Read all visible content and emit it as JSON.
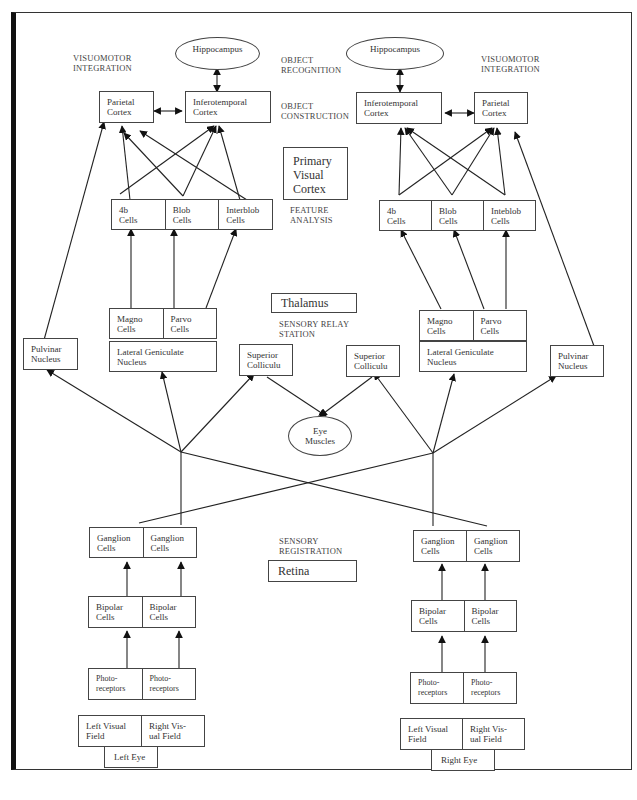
{
  "labels": {
    "visuomotor_left": "VISUOMOTOR\nINTEGRATION",
    "visuomotor_right": "VISUOMOTOR\nINTEGRATION",
    "object_recognition": "OBJECT\nRECOGNITION",
    "object_construction": "OBJECT\nCONSTRUCTION",
    "feature_analysis": "FEATURE\nANALYSIS",
    "sensory_relay": "SENSORY RELAY\nSTATION",
    "sensory_registration": "SENSORY\nREGISTRATION"
  },
  "region_boxes": {
    "primary_visual_cortex": "Primary\nVisual\nCortex",
    "thalamus": "Thalamus",
    "retina": "Retina"
  },
  "left": {
    "hippocampus": "Hippocampus",
    "parietal": "Parietal\nCortex",
    "inferotemporal": "Inferotemporal\nCortex",
    "cortex_cells": [
      "4b\nCells",
      "Blob\nCells",
      "Interblob\nCells"
    ],
    "lgn_cells": [
      "Magno\nCells",
      "Parvo\nCells"
    ],
    "lgn": "Lateral Geniculate\nNucleus",
    "pulvinar": "Pulvinar\nNucleus",
    "superior_colliculus": "Superior\nColliculu",
    "ganglion": [
      "Ganglion\nCells",
      "Ganglion\nCells"
    ],
    "bipolar": [
      "Bipolar\nCells",
      "Bipolar\nCells"
    ],
    "photoreceptors": [
      "Photo-\nreceptors",
      "Photo-\nreceptors"
    ],
    "visual_fields": [
      "Left Visual\nField",
      "Right Vis-\nual Field"
    ],
    "eye": "Left Eye"
  },
  "right": {
    "hippocampus": "Hippocampus",
    "parietal": "Parietal\nCortex",
    "inferotemporal": "Inferotemporal\nCortex",
    "cortex_cells": [
      "4b\nCells",
      "Blob\nCells",
      "Inteblob\nCells"
    ],
    "lgn_cells": [
      "Magno\nCells",
      "Parvo\nCells"
    ],
    "lgn": "Lateral Geniculate\nNucleus",
    "pulvinar": "Pulvinar\nNucleus",
    "superior_colliculus": "Superior\nColliculu",
    "ganglion": [
      "Ganglion\nCells",
      "Ganglion\nCells"
    ],
    "bipolar": [
      "Bipolar\nCells",
      "Bipolar\nCells"
    ],
    "photoreceptors": [
      "Photo-\nreceptors",
      "Photo-\nreceptors"
    ],
    "visual_fields": [
      "Left Visual\nField",
      "Right Vis-\nual Field"
    ],
    "eye": "Right Eye"
  },
  "center": {
    "eye_muscles": "Eye\nMuscles"
  }
}
